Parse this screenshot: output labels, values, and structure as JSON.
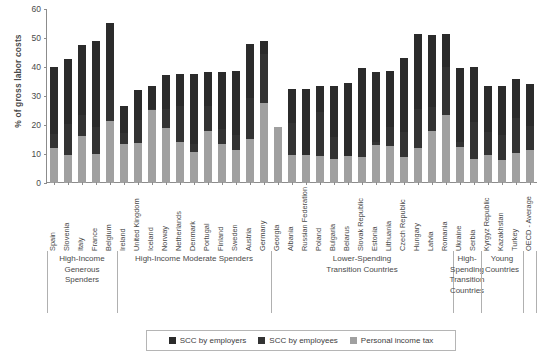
{
  "chart_data": {
    "type": "bar",
    "stacked": true,
    "title": "",
    "xlabel": "",
    "ylabel": "% of gross labor costs",
    "ylim": [
      0,
      60
    ],
    "yticks": [
      0,
      10,
      20,
      30,
      40,
      50,
      60
    ],
    "grid": false,
    "legend_position": "bottom",
    "legend": [
      "SCC by employers",
      "SCC by employees",
      "Personal income tax"
    ],
    "colors": {
      "scc_employers": "#2b2b2b",
      "scc_employees": "#333333",
      "personal_income_tax": "#a0a0a0",
      "axis": "#8c8c8c",
      "text": "#4a4a4a"
    },
    "categories": [
      "Spain",
      "Slovenia",
      "Italy",
      "France",
      "Belgium",
      "Ireland",
      "United Kingdom",
      "Iceland",
      "Norway",
      "Netherlands",
      "Denmark",
      "Portugal",
      "Finland",
      "Sweden",
      "Austria",
      "Germany",
      "Georgia",
      "Albania",
      "Russian Federation",
      "Poland",
      "Bulgaria",
      "Belarus",
      "Slovak Republic",
      "Estonia",
      "Lithuania",
      "Czech Republic",
      "Hungary",
      "Latvia",
      "Romania",
      "Ukraine",
      "Serbia",
      "Kyrgyz Republic",
      "Kazakhstan",
      "Turkey",
      "OECD - Average"
    ],
    "series": [
      {
        "name": "Personal income tax",
        "key": "personal_income_tax",
        "values": [
          12.0,
          9.7,
          16.2,
          10.0,
          21.5,
          13.4,
          13.8,
          25.3,
          18.8,
          14.0,
          10.6,
          18.0,
          13.3,
          11.3,
          15.2,
          27.5,
          19.4,
          9.8,
          9.8,
          9.3,
          8.3,
          9.3,
          9.0,
          13.0,
          12.7,
          9.1,
          12.0,
          17.8,
          23.4,
          12.3,
          8.3,
          9.5,
          8.0,
          10.4,
          11.3
        ]
      },
      {
        "name": "SCC by employees",
        "key": "scc_employees",
        "values": [
          4.9,
          10.5,
          7.3,
          9.4,
          10.6,
          4.0,
          8.1,
          0.3,
          6.8,
          12.5,
          2.8,
          8.5,
          5.2,
          5.3,
          14.0,
          17.0,
          0.0,
          11.0,
          0.0,
          15.3,
          7.7,
          0.0,
          9.4,
          1.2,
          6.7,
          8.5,
          13.5,
          8.5,
          16.6,
          2.0,
          12.7,
          8.0,
          8.5,
          12.1,
          8.4
        ]
      },
      {
        "name": "SCC by employers",
        "key": "scc_employers",
        "values": [
          23.0,
          22.5,
          24.0,
          29.7,
          23.1,
          9.3,
          10.3,
          8.0,
          11.8,
          11.0,
          24.2,
          11.9,
          19.9,
          21.9,
          18.7,
          4.5,
          0.0,
          11.5,
          22.5,
          9.0,
          17.5,
          25.2,
          21.3,
          24.0,
          19.3,
          25.4,
          25.8,
          24.8,
          11.3,
          25.5,
          19.0,
          15.8,
          17.0,
          13.3,
          14.4
        ]
      }
    ],
    "totals": [
      39.9,
      42.7,
      47.5,
      49.1,
      55.2,
      26.7,
      32.2,
      33.6,
      37.4,
      37.5,
      37.6,
      38.4,
      38.4,
      38.5,
      47.9,
      49.0,
      19.4,
      32.3,
      32.3,
      33.6,
      33.5,
      34.5,
      39.7,
      38.2,
      38.7,
      43.0,
      51.3,
      51.1,
      51.3,
      39.8,
      40.0,
      33.3,
      33.5,
      35.8,
      34.1
    ],
    "groups": [
      {
        "label": "High-Income\nGenerous\nSpenders",
        "start": 0,
        "end": 4
      },
      {
        "label": "High-Income Moderate Spenders",
        "start": 5,
        "end": 15
      },
      {
        "label": "Lower-Spending\nTransition Countries",
        "start": 16,
        "end": 28
      },
      {
        "label": "High-\nSpending\nTransition\nCountries",
        "start": 29,
        "end": 30
      },
      {
        "label": "Young\nCountries",
        "start": 31,
        "end": 33
      },
      {
        "label": "",
        "start": 34,
        "end": 34
      }
    ]
  },
  "axis": {
    "ylabel": "% of gross labor costs",
    "ytick_labels": [
      "0",
      "10",
      "20",
      "30",
      "40",
      "50",
      "60"
    ]
  },
  "legend": {
    "items": [
      {
        "label": "SCC by employers",
        "color": "#2b2b2b"
      },
      {
        "label": "SCC by employees",
        "color": "#333333"
      },
      {
        "label": "Personal income tax",
        "color": "#a0a0a0"
      }
    ]
  },
  "group_labels": {
    "g0_l0": "High-Income",
    "g0_l1": "Generous",
    "g0_l2": "Spenders",
    "g1_l0": "High-Income Moderate Spenders",
    "g2_l0": "Lower-Spending",
    "g2_l1": "Transition Countries",
    "g3_l0": "High-",
    "g3_l1": "Spending",
    "g3_l2": "Transition",
    "g3_l3": "Countries",
    "g4_l0": "Young",
    "g4_l1": "Countries"
  }
}
